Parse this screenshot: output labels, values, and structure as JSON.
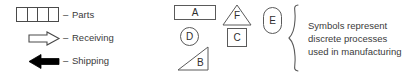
{
  "figure": {
    "background_color": "#ffffff",
    "line_color": "#4a4a4a",
    "text_color": "#3a3a3a",
    "fill_shipping_arrow": "#000000",
    "fill_receiving_arrow": "#ffffff"
  },
  "legend": {
    "dash": "–",
    "items": [
      {
        "symbol": "segmented-rectangle",
        "segments": 4,
        "label": "Parts"
      },
      {
        "symbol": "hollow-right-arrow",
        "label": "Receiving"
      },
      {
        "symbol": "solid-left-arrow",
        "label": "Shipping"
      }
    ]
  },
  "process_symbols": [
    {
      "id": "A",
      "shape": "rectangle-wide",
      "letter": "A"
    },
    {
      "id": "D",
      "shape": "circle",
      "letter": "D"
    },
    {
      "id": "B",
      "shape": "right-triangle",
      "letter": "B"
    },
    {
      "id": "F",
      "shape": "triangle",
      "letter": "F"
    },
    {
      "id": "C",
      "shape": "square",
      "letter": "C"
    },
    {
      "id": "E",
      "shape": "rounded-rectangle",
      "letter": "E"
    }
  ],
  "caption": {
    "lines": [
      "Symbols represent",
      "discrete processes",
      "used in manufacturing"
    ]
  }
}
